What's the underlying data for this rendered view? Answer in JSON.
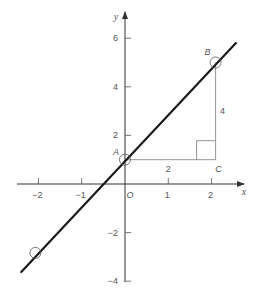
{
  "chart_data": {
    "type": "line",
    "title": "",
    "xlabel": "x",
    "ylabel": "y",
    "xlim": [
      -2.4,
      2.7
    ],
    "ylim": [
      -4,
      7
    ],
    "x_ticks": [
      {
        "value": -2,
        "label": "−2"
      },
      {
        "value": -1,
        "label": "−1"
      },
      {
        "value": 0,
        "label": "O"
      },
      {
        "value": 1,
        "label": "1"
      },
      {
        "value": 2,
        "label": "2"
      }
    ],
    "y_ticks": [
      {
        "value": 6,
        "label": "6"
      },
      {
        "value": 4,
        "label": "4"
      },
      {
        "value": 2,
        "label": "2"
      },
      {
        "value": -2,
        "label": "−2"
      },
      {
        "value": -4,
        "label": "−4"
      }
    ],
    "grid": false,
    "series": [
      {
        "name": "line",
        "equation": "y = 2x + 1",
        "x": [
          -2.35,
          2.4
        ],
        "y": [
          -3.7,
          5.8
        ],
        "color": "#1a1a1a"
      }
    ],
    "points": [
      {
        "label": "A",
        "x": 0,
        "y": 1
      },
      {
        "label": "B",
        "x": 2,
        "y": 5
      },
      {
        "label": "",
        "x": -2,
        "y": -3
      }
    ],
    "triangle": {
      "vertices": [
        "A",
        "B",
        "C"
      ],
      "C": {
        "label": "C",
        "x": 2,
        "y": 1
      },
      "run_label": "2",
      "rise_label": "4"
    }
  }
}
